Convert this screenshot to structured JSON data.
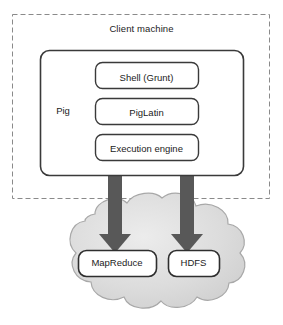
{
  "diagram": {
    "type": "block-diagram",
    "boundary": {
      "label": "Client machine",
      "style": "dashed-rectangle",
      "border_color": "#8a8a8a"
    },
    "pig": {
      "label": "Pig",
      "style": "rounded-rectangle",
      "border_color": "#3a3a3a",
      "fill_color": "#ffffff",
      "components": [
        {
          "label": "Shell (Grunt)"
        },
        {
          "label": "PigLatin"
        },
        {
          "label": "Execution engine"
        }
      ]
    },
    "cloud": {
      "name": "hadoop-cluster-cloud",
      "fill_color": "#d9d9d9",
      "border_color": "#a6a6a6",
      "nodes": [
        {
          "label": "MapReduce"
        },
        {
          "label": "HDFS"
        }
      ]
    },
    "arrows": [
      {
        "name": "pig-to-mapreduce-arrow",
        "from": "Pig",
        "to": "MapReduce",
        "color": "#585858",
        "direction": "down"
      },
      {
        "name": "pig-to-hdfs-arrow",
        "from": "Pig",
        "to": "HDFS",
        "color": "#585858",
        "direction": "down"
      }
    ]
  }
}
